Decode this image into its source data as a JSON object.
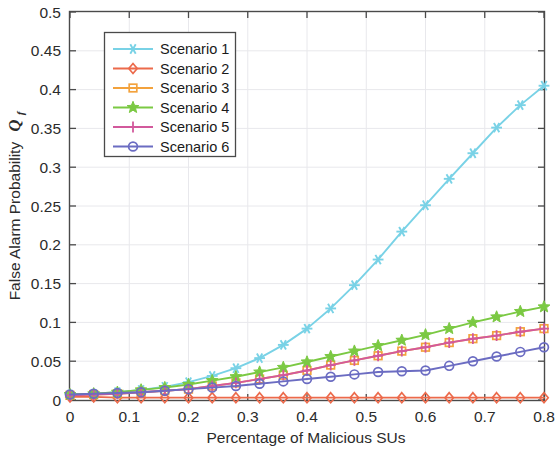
{
  "chart_data": {
    "type": "line",
    "title": "",
    "xlabel": "Percentage of Malicious SUs",
    "ylabel": "False Alarm Probability",
    "ylabel_symbol": "Q",
    "ylabel_symbol_sub": "f",
    "xlim": [
      0,
      0.8
    ],
    "ylim": [
      0,
      0.5
    ],
    "xticks": [
      0,
      0.1,
      0.2,
      0.3,
      0.4,
      0.5,
      0.6,
      0.7,
      0.8
    ],
    "xtick_labels": [
      "0",
      "0.1",
      "0.2",
      "0.3",
      "0.4",
      "0.5",
      "0.6",
      "0.7",
      "0.8"
    ],
    "yticks": [
      0,
      0.05,
      0.1,
      0.15,
      0.2,
      0.25,
      0.3,
      0.35,
      0.4,
      0.45,
      0.5
    ],
    "ytick_labels": [
      "0",
      "0.05",
      "0.1",
      "0.15",
      "0.2",
      "0.25",
      "0.3",
      "0.35",
      "0.4",
      "0.45",
      "0.5"
    ],
    "grid": true,
    "legend_position": "upper-left",
    "x": [
      0,
      0.04,
      0.08,
      0.12,
      0.16,
      0.2,
      0.24,
      0.28,
      0.32,
      0.36,
      0.4,
      0.44,
      0.48,
      0.52,
      0.56,
      0.6,
      0.64,
      0.68,
      0.72,
      0.76,
      0.8
    ],
    "series": [
      {
        "name": "Scenario 1",
        "color": "#79d2e6",
        "marker": "asterisk",
        "values": [
          0.007,
          0.008,
          0.01,
          0.013,
          0.017,
          0.023,
          0.031,
          0.041,
          0.054,
          0.071,
          0.092,
          0.118,
          0.148,
          0.181,
          0.217,
          0.251,
          0.285,
          0.318,
          0.351,
          0.38,
          0.405
        ]
      },
      {
        "name": "Scenario 2",
        "color": "#ec6a4b",
        "marker": "diamond",
        "values": [
          0.004,
          0.004,
          0.003,
          0.003,
          0.003,
          0.003,
          0.003,
          0.003,
          0.003,
          0.003,
          0.003,
          0.003,
          0.003,
          0.003,
          0.003,
          0.003,
          0.003,
          0.003,
          0.003,
          0.003,
          0.003
        ]
      },
      {
        "name": "Scenario 3",
        "color": "#f3a23c",
        "marker": "square",
        "values": [
          0.006,
          0.007,
          0.008,
          0.01,
          0.012,
          0.014,
          0.018,
          0.022,
          0.027,
          0.032,
          0.038,
          0.045,
          0.051,
          0.057,
          0.063,
          0.068,
          0.074,
          0.079,
          0.083,
          0.088,
          0.092
        ]
      },
      {
        "name": "Scenario 4",
        "color": "#7bc943",
        "marker": "star",
        "values": [
          0.007,
          0.008,
          0.01,
          0.013,
          0.016,
          0.02,
          0.025,
          0.03,
          0.036,
          0.042,
          0.049,
          0.056,
          0.063,
          0.07,
          0.077,
          0.084,
          0.092,
          0.1,
          0.107,
          0.114,
          0.12
        ]
      },
      {
        "name": "Scenario 5",
        "color": "#d2599c",
        "marker": "plus",
        "values": [
          0.006,
          0.007,
          0.008,
          0.01,
          0.012,
          0.014,
          0.018,
          0.022,
          0.027,
          0.032,
          0.038,
          0.045,
          0.051,
          0.057,
          0.063,
          0.068,
          0.074,
          0.079,
          0.083,
          0.088,
          0.092
        ]
      },
      {
        "name": "Scenario 6",
        "color": "#6b6cc2",
        "marker": "circle",
        "values": [
          0.007,
          0.008,
          0.009,
          0.01,
          0.012,
          0.014,
          0.016,
          0.018,
          0.021,
          0.024,
          0.027,
          0.03,
          0.033,
          0.036,
          0.037,
          0.038,
          0.044,
          0.05,
          0.056,
          0.062,
          0.068
        ]
      }
    ]
  }
}
